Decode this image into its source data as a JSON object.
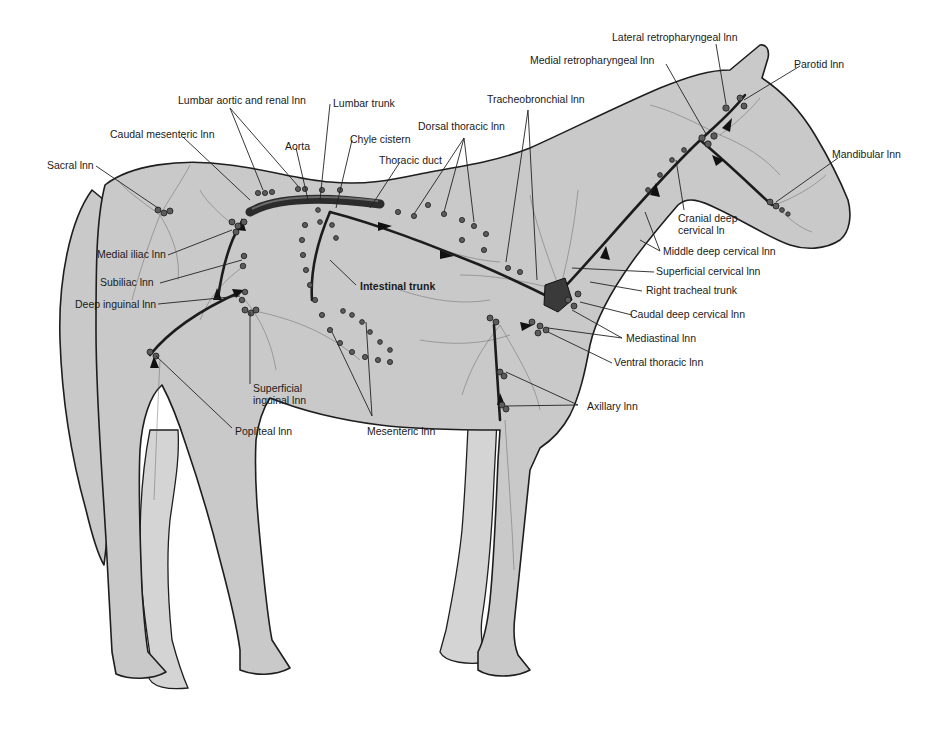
{
  "figure": {
    "colors": {
      "body": "#c9c9c9",
      "outline": "#1e1e1e",
      "vessel": "#3a3a3a",
      "label_text": "#1a1a1a",
      "background": "#ffffff"
    }
  },
  "labels": {
    "lateral_retropharyngeal": "Lateral retropharyngeal lnn",
    "medial_retropharyngeal": "Medial retropharyngeal lnn",
    "parotid": "Parotid lnn",
    "mandibular": "Mandibular lnn",
    "tracheobronchial": "Tracheobronchial lnn",
    "lumbar_aortic_renal": "Lumbar aortic and renal lnn",
    "lumbar_trunk": "Lumbar trunk",
    "caudal_mesenteric": "Caudal mesenteric lnn",
    "aorta": "Aorta",
    "chyle_cistern": "Chyle cistern",
    "dorsal_thoracic": "Dorsal thoracic lnn",
    "thoracic_duct": "Thoracic duct",
    "sacral": "Sacral lnn",
    "medial_iliac": "Medial iliac lnn",
    "subiliac": "Subiliac lnn",
    "deep_inguinal": "Deep inguinal lnn",
    "intestinal_trunk": "Intestinal trunk",
    "cranial_deep_cervical_1": "Cranial deep",
    "cranial_deep_cervical_2": "cervical ln",
    "middle_deep_cervical": "Middle deep cervical lnn",
    "superficial_cervical": "Superficial cervical lnn",
    "right_tracheal_trunk": "Right tracheal trunk",
    "caudal_deep_cervical": "Caudal deep cervical lnn",
    "mediastinal": "Mediastinal lnn",
    "ventral_thoracic": "Ventral thoracic lnn",
    "superficial_inguinal_1": "Superficial",
    "superficial_inguinal_2": "inguinal lnn",
    "popliteal": "Popliteal lnn",
    "mesenteric": "Mesenteric lnn",
    "axillary": "Axillary lnn"
  }
}
